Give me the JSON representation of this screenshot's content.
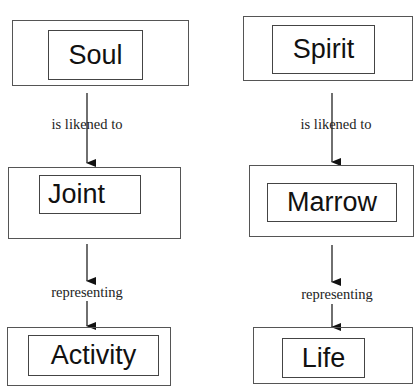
{
  "diagram": {
    "left_column": {
      "nodes": [
        {
          "id": "soul",
          "label": "Soul"
        },
        {
          "id": "joint",
          "label": "Joint"
        },
        {
          "id": "activity",
          "label": "Activity"
        }
      ],
      "edges": [
        {
          "from": "soul",
          "to": "joint",
          "label": "is likened to"
        },
        {
          "from": "joint",
          "to": "activity",
          "label": "representing"
        }
      ]
    },
    "right_column": {
      "nodes": [
        {
          "id": "spirit",
          "label": "Spirit"
        },
        {
          "id": "marrow",
          "label": "Marrow"
        },
        {
          "id": "life",
          "label": "Life"
        }
      ],
      "edges": [
        {
          "from": "spirit",
          "to": "marrow",
          "label": "is likened to"
        },
        {
          "from": "marrow",
          "to": "life",
          "label": "representing"
        }
      ]
    }
  },
  "colors": {
    "border": "#555555",
    "text": "#111111",
    "background": "#ffffff"
  }
}
